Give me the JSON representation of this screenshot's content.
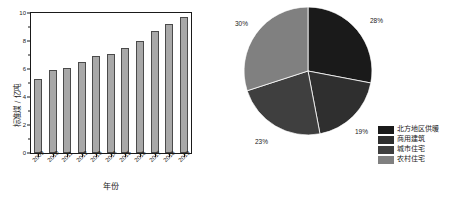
{
  "chart_data": [
    {
      "type": "bar",
      "title": "",
      "xlabel": "年份",
      "ylabel": "标准煤 / 亿吨",
      "categories": [
        "2009",
        "2010",
        "2011",
        "2012",
        "2013",
        "2014",
        "2015",
        "2016",
        "2017",
        "2018",
        "2019"
      ],
      "values": [
        5.3,
        5.9,
        6.1,
        6.5,
        6.95,
        7.1,
        7.5,
        8.0,
        8.75,
        9.25,
        9.7
      ],
      "ylim": [
        0,
        10
      ],
      "yticks": [
        0,
        2,
        4,
        6,
        8,
        10
      ],
      "ytick_labels": [
        "0",
        "2",
        "4",
        "6",
        "8",
        "10"
      ],
      "grid": false,
      "legend": "none",
      "bar_color": "#a8a8a8",
      "bar_edge_color": "#4a4a4a"
    },
    {
      "type": "pie",
      "title": "",
      "labels": [
        "北方地区供暖",
        "商用建筑",
        "城市住宅",
        "农村住宅"
      ],
      "values": [
        28,
        19,
        23,
        30
      ],
      "value_labels": [
        "28%",
        "19%",
        "23%",
        "30%"
      ],
      "colors": [
        "#1a1a1a",
        "#2f2f2f",
        "#3f3f3f",
        "#808080"
      ],
      "legend": "bottom-right",
      "startangle": 90,
      "counterclock": false
    }
  ],
  "bar_chart": {
    "y_axis_title": "标准煤 / 亿吨",
    "x_axis_title": "年份",
    "y_ticks": [
      "10",
      "8",
      "6",
      "4",
      "2",
      "0"
    ],
    "x_ticks": [
      "2009",
      "2010",
      "2011",
      "2012",
      "2013",
      "2014",
      "2015",
      "2016",
      "2017",
      "2018",
      "2019"
    ]
  },
  "pie_chart": {
    "percent_top_right": "28%",
    "percent_left": "30%",
    "percent_bottom": "23%",
    "percent_right": "19%",
    "legend": [
      {
        "label": "北方地区供暖",
        "color": "#1a1a1a"
      },
      {
        "label": "商用建筑",
        "color": "#2f2f2f"
      },
      {
        "label": "城市住宅",
        "color": "#3f3f3f"
      },
      {
        "label": "农村住宅",
        "color": "#808080"
      }
    ]
  }
}
